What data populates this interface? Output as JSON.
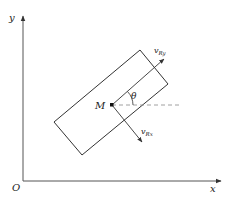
{
  "diagram": {
    "axes": {
      "origin_label": "O",
      "x_label": "x",
      "y_label": "y"
    },
    "point_label": "M",
    "angle_label": "θ",
    "velocity_y_label": "v",
    "velocity_y_sub": "Ry",
    "velocity_x_label": "v",
    "velocity_x_sub": "Rx",
    "colors": {
      "line": "#333333",
      "axis": "#555555",
      "dashed": "#888888"
    }
  }
}
